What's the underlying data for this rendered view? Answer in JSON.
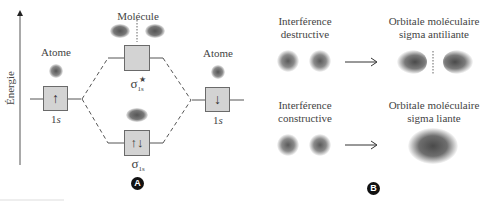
{
  "panel_a": {
    "badge": "A",
    "axis_label": "Énergie",
    "left_atom": {
      "title": "Atome",
      "orbital": "1",
      "orbital_sub": "s",
      "electron": "↑"
    },
    "right_atom": {
      "title": "Atome",
      "orbital": "1",
      "orbital_sub": "s",
      "electron": "↓"
    },
    "molecule": {
      "title": "Molécule",
      "antibonding": {
        "symbol": "σ",
        "sub": "1s",
        "sup": "★",
        "electrons": ""
      },
      "bonding": {
        "symbol": "σ",
        "sub": "1s",
        "electrons": "↑↓"
      }
    }
  },
  "panel_b": {
    "badge": "B",
    "destructive": {
      "left_label_line1": "Interférence",
      "left_label_line2": "destructive",
      "right_label_line1": "Orbitale moléculaire",
      "right_label_line2": "sigma antiliante",
      "arrow": "⟶"
    },
    "constructive": {
      "left_label_line1": "Interférence",
      "left_label_line2": "constructive",
      "right_label_line1": "Orbitale moléculaire",
      "right_label_line2": "sigma liante",
      "arrow": "⟶"
    }
  },
  "colors": {
    "box_fill": "#d3d3d3",
    "box_border": "#6a6a6a",
    "blob": "#5a5a5a",
    "line": "#555555"
  }
}
